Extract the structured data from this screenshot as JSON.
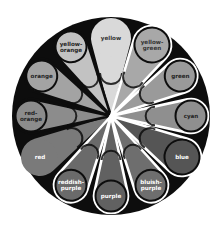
{
  "diagram": {
    "type": "color-wheel",
    "center": [
      111,
      116
    ],
    "radius": 99,
    "background": "#0d0d0d",
    "petals": [
      {
        "label": "yellow",
        "lines": [
          "yellow"
        ],
        "angle": 0,
        "fill": "#d9d9d9",
        "stroke": "none",
        "text": "#333333",
        "head": 20,
        "len": 78
      },
      {
        "label": "yellow-green",
        "lines": [
          "yellow-",
          "green"
        ],
        "angle": 30,
        "fill": "#a8a8a8",
        "stroke": "#ffffff",
        "text": "#333333",
        "head": 19,
        "len": 82
      },
      {
        "label": "green",
        "lines": [
          "green"
        ],
        "angle": 60,
        "fill": "#9a9a9a",
        "stroke": "#ffffff",
        "text": "#222222",
        "head": 17,
        "len": 80
      },
      {
        "label": "cyan",
        "lines": [
          "cyan"
        ],
        "angle": 90,
        "fill": "#8f8f8f",
        "stroke": "#ffffff",
        "text": "#222222",
        "head": 17,
        "len": 80
      },
      {
        "label": "blue",
        "lines": [
          "blue"
        ],
        "angle": 120,
        "fill": "#555555",
        "stroke": "#ffffff",
        "text": "#ffffff",
        "head": 19,
        "len": 82
      },
      {
        "label": "bluish-purple",
        "lines": [
          "bluish-",
          "purple"
        ],
        "angle": 150,
        "fill": "#6e6e6e",
        "stroke": "#ffffff",
        "text": "#ffffff",
        "head": 17,
        "len": 80
      },
      {
        "label": "purple",
        "lines": [
          "purple"
        ],
        "angle": 180,
        "fill": "#616161",
        "stroke": "#ffffff",
        "text": "#ffffff",
        "head": 17,
        "len": 80
      },
      {
        "label": "reddish-purple",
        "lines": [
          "reddish-",
          "purple"
        ],
        "angle": 210,
        "fill": "#6a6a6a",
        "stroke": "#ffffff",
        "text": "#ffffff",
        "head": 17,
        "len": 80
      },
      {
        "label": "red",
        "lines": [
          "red"
        ],
        "angle": 240,
        "fill": "#7a7a7a",
        "stroke": "none",
        "text": "#ffffff",
        "head": 19,
        "len": 82
      },
      {
        "label": "red-orange",
        "lines": [
          "red-",
          "orange"
        ],
        "angle": 270,
        "fill": "#8c8c8c",
        "stroke": "#0d0d0d",
        "text": "#222222",
        "head": 17,
        "len": 80
      },
      {
        "label": "orange",
        "lines": [
          "orange"
        ],
        "angle": 300,
        "fill": "#a3a3a3",
        "stroke": "#0d0d0d",
        "text": "#222222",
        "head": 17,
        "len": 80
      },
      {
        "label": "yellow-orange",
        "lines": [
          "yellow-",
          "orange"
        ],
        "angle": 330,
        "fill": "#c2c2c2",
        "stroke": "#0d0d0d",
        "text": "#222222",
        "head": 17,
        "len": 80
      }
    ]
  }
}
